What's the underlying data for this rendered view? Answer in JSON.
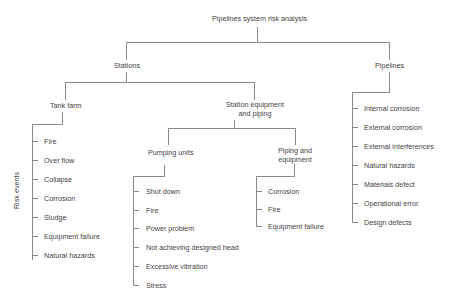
{
  "title": "Pipelines system risk analysis",
  "side_label": "Risk events",
  "stations": {
    "label": "Stations",
    "tank_farm": {
      "label": "Tank farm",
      "items": [
        "Fire",
        "Over flow",
        "Collapse",
        "Corrosion",
        "Sludge",
        "Equipment failure",
        "Natural hazards"
      ]
    },
    "station_equipment": {
      "label_line1": "Station equipment",
      "label_line2": "and piping",
      "pumping_units": {
        "label": "Pumping units",
        "items": [
          "Shut down",
          "Fire",
          "Power problem",
          "Not achieving designed head",
          "Excessive vibration",
          "Stress"
        ]
      },
      "piping_equipment": {
        "label_line1": "Piping and",
        "label_line2": "equipment",
        "items": [
          "Corrosion",
          "Fire",
          "Equipment failure"
        ]
      }
    }
  },
  "pipelines": {
    "label": "Pipelines",
    "items": [
      "Internal corrosion",
      "External corrosion",
      "External interferences",
      "Natural hazards",
      "Materials defect",
      "Operational error",
      "Design defects"
    ]
  }
}
